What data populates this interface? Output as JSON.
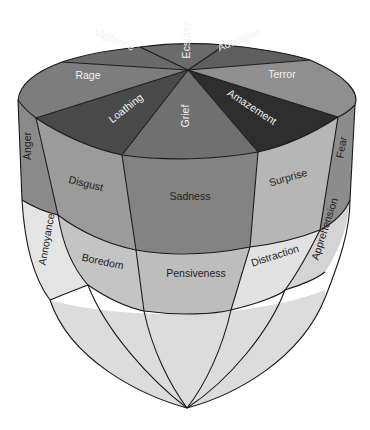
{
  "diagram": {
    "top_face": [
      {
        "label": "Ecstasy",
        "color": "#6b6b6b"
      },
      {
        "label": "Adoration",
        "color": "#5e5e5e"
      },
      {
        "label": "Terror",
        "color": "#8f8f8f"
      },
      {
        "label": "Amazement",
        "color": "#2e2e2e"
      },
      {
        "label": "Grief",
        "color": "#707070"
      },
      {
        "label": "Loathing",
        "color": "#4a4a4a"
      },
      {
        "label": "Rage",
        "color": "#7d7d7d"
      },
      {
        "label": "Vigilance",
        "color": "#6a6a6a"
      }
    ],
    "band_1": [
      {
        "label": "Anger",
        "color": "#8a8a8a"
      },
      {
        "label": "Disgust",
        "color": "#9b9b9b"
      },
      {
        "label": "Sadness",
        "color": "#838383"
      },
      {
        "label": "Surprise",
        "color": "#b6b6b6"
      },
      {
        "label": "Fear",
        "color": "#8c8c8c"
      }
    ],
    "band_2": [
      {
        "label": "Annoyance",
        "color": "#e4e4e4"
      },
      {
        "label": "Boredom",
        "color": "#c4c4c4"
      },
      {
        "label": "Pensiveness",
        "color": "#bdbdbd"
      },
      {
        "label": "Distraction",
        "color": "#e2e2e2"
      },
      {
        "label": "Apprehension",
        "color": "#d4d4d4"
      }
    ],
    "bottom_color": "#dcdcdc"
  }
}
